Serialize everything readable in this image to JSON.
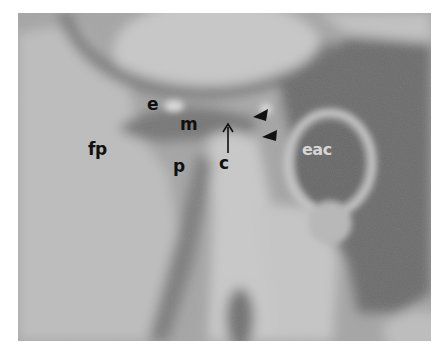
{
  "figure": {
    "type": "grayscale radiographic image",
    "labels": [
      {
        "id": "e",
        "text": "e",
        "x": 147,
        "y": 96
      },
      {
        "id": "m",
        "text": "m",
        "x": 180,
        "y": 116
      },
      {
        "id": "fp",
        "text": "fp",
        "x": 88,
        "y": 141
      },
      {
        "id": "p",
        "text": "p",
        "x": 173,
        "y": 158
      },
      {
        "id": "c",
        "text": "c",
        "x": 219,
        "y": 155
      },
      {
        "id": "eac",
        "text": "eac",
        "x": 300,
        "y": 140
      }
    ],
    "arrow": {
      "label_ref": "c",
      "direction": "up",
      "x": 228,
      "y_start": 153,
      "y_end": 125
    },
    "arrowheads": [
      {
        "x": 261,
        "y": 113,
        "direction": "left"
      },
      {
        "x": 270,
        "y": 134,
        "direction": "left"
      }
    ],
    "colors": {
      "background": "#a9a9a9",
      "dark_tissue": "#6e6e6e",
      "light_bone": "#c6c6c6",
      "label_dark": "#111111",
      "label_light": "#d6d6d6"
    }
  }
}
